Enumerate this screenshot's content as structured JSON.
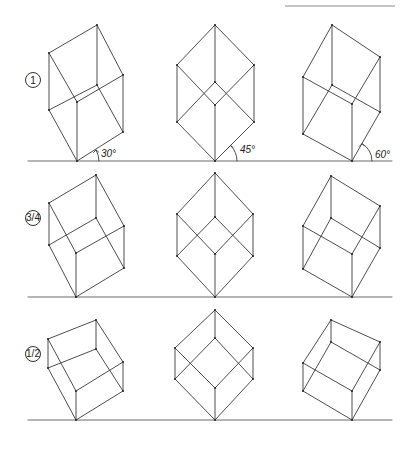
{
  "header": {
    "text": ""
  },
  "rows": [
    {
      "label": "1",
      "scale": "1"
    },
    {
      "label": "3/4",
      "scale": "3/4"
    },
    {
      "label": "1/2",
      "scale": "1/2"
    }
  ],
  "angle_labels": [
    "30°",
    "45°",
    "60°"
  ],
  "angles_deg": [
    30,
    45,
    60
  ]
}
